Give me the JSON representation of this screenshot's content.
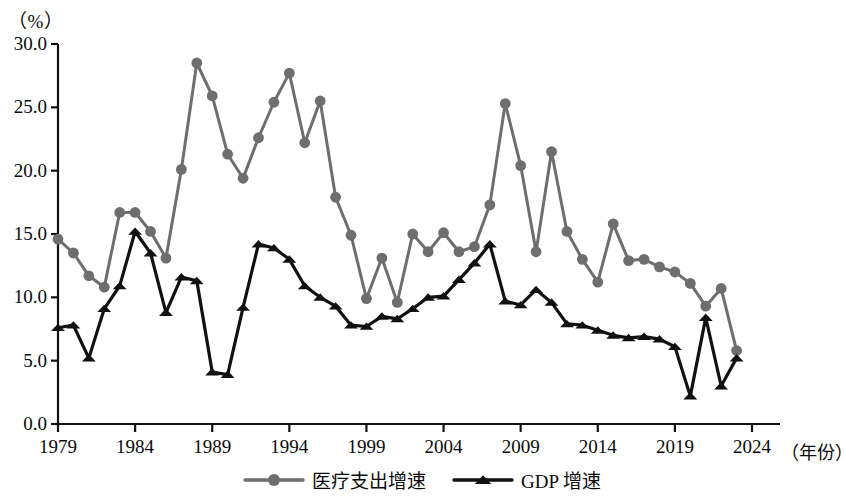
{
  "axis": {
    "unit_label": "（%）",
    "x_axis_title": "（年份）",
    "y_ticks": [
      "30.0",
      "25.0",
      "20.0",
      "15.0",
      "10.0",
      "5.0",
      "0.0"
    ],
    "x_ticks": [
      "1979",
      "1984",
      "1989",
      "1994",
      "1999",
      "2004",
      "2009",
      "2014",
      "2019",
      "2024"
    ]
  },
  "legend": {
    "items": [
      {
        "label": "医疗支出增速",
        "marker": "circle",
        "color": "#6e6e6e"
      },
      {
        "label": "GDP 增速",
        "marker": "triangle",
        "color": "#111111"
      }
    ]
  },
  "chart_data": {
    "type": "line",
    "title": "",
    "subtitle": "",
    "xlabel": "（年份）",
    "ylabel": "（%）",
    "xlim": [
      1979,
      2024
    ],
    "ylim": [
      0.0,
      30.0
    ],
    "ytick_step": 5.0,
    "xtick_step": 5,
    "grid": false,
    "legend_position": "bottom-center",
    "x": [
      1979,
      1980,
      1981,
      1982,
      1983,
      1984,
      1985,
      1986,
      1987,
      1988,
      1989,
      1990,
      1991,
      1992,
      1993,
      1994,
      1995,
      1996,
      1997,
      1998,
      1999,
      2000,
      2001,
      2002,
      2003,
      2004,
      2005,
      2006,
      2007,
      2008,
      2009,
      2010,
      2011,
      2012,
      2013,
      2014,
      2015,
      2016,
      2017,
      2018,
      2019,
      2020,
      2021,
      2022,
      2023
    ],
    "series": [
      {
        "name": "医疗支出增速",
        "marker": "circle",
        "color": "#6e6e6e",
        "values": [
          14.6,
          13.5,
          11.7,
          10.8,
          16.7,
          16.7,
          15.2,
          13.1,
          20.1,
          28.5,
          25.9,
          21.3,
          19.4,
          22.6,
          25.4,
          27.7,
          22.2,
          25.5,
          17.9,
          14.9,
          9.9,
          13.1,
          9.6,
          15.0,
          13.6,
          15.1,
          13.6,
          14.0,
          17.3,
          25.3,
          20.4,
          13.6,
          21.5,
          15.2,
          13.0,
          11.2,
          15.8,
          12.9,
          13.0,
          12.4,
          12.0,
          11.1,
          9.3,
          10.7,
          5.8
        ]
      },
      {
        "name": "GDP 增速",
        "marker": "triangle",
        "color": "#111111",
        "values": [
          7.6,
          7.8,
          5.2,
          9.1,
          10.9,
          15.2,
          13.5,
          8.8,
          11.6,
          11.3,
          4.1,
          3.9,
          9.2,
          14.2,
          13.9,
          13.0,
          10.9,
          10.0,
          9.3,
          7.8,
          7.7,
          8.5,
          8.3,
          9.1,
          10.0,
          10.1,
          11.4,
          12.7,
          14.2,
          9.7,
          9.4,
          10.6,
          9.6,
          7.9,
          7.8,
          7.4,
          7.0,
          6.8,
          6.9,
          6.7,
          6.1,
          2.2,
          8.4,
          3.0,
          5.2
        ]
      }
    ]
  }
}
